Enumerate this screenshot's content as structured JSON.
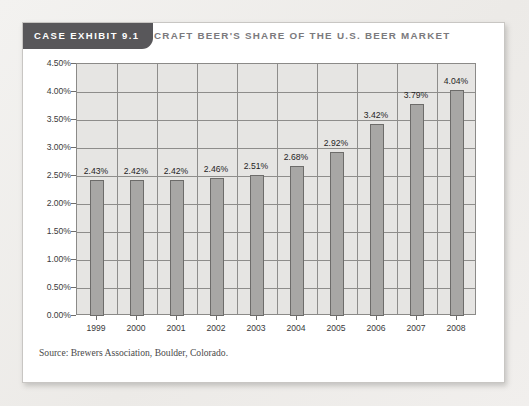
{
  "exhibit": {
    "tab_label": "CASE EXHIBIT 9.1",
    "title": "CRAFT BEER'S SHARE OF THE U.S. BEER MARKET",
    "source_note": "Source: Brewers Association, Boulder, Colorado.",
    "colors": {
      "tab_background": "#58575a",
      "title_text": "#7b7a7d",
      "card_background": "#ffffff",
      "page_background": "#f0efed",
      "plot_background": "#e6e5e3",
      "bar_fill": "#a8a7a5",
      "bar_border": "#6d6c6a",
      "gridline": "#8e8d8b"
    }
  },
  "chart_data": {
    "type": "bar",
    "title": "CRAFT BEER'S SHARE OF THE U.S. BEER MARKET",
    "xlabel": "",
    "ylabel": "",
    "categories": [
      "1999",
      "2000",
      "2001",
      "2002",
      "2003",
      "2004",
      "2005",
      "2006",
      "2007",
      "2008"
    ],
    "values": [
      2.43,
      2.42,
      2.42,
      2.46,
      2.51,
      2.68,
      2.92,
      3.42,
      3.79,
      4.04
    ],
    "data_labels": [
      "2.43%",
      "2.42%",
      "2.42%",
      "2.46%",
      "2.51%",
      "2.68%",
      "2.92%",
      "3.42%",
      "3.79%",
      "4.04%"
    ],
    "ylim": [
      0,
      4.5
    ],
    "ytick_values": [
      0,
      0.5,
      1.0,
      1.5,
      2.0,
      2.5,
      3.0,
      3.5,
      4.0,
      4.5
    ],
    "ytick_labels": [
      "0.00%",
      "0.50%",
      "1.00%",
      "1.50%",
      "2.00%",
      "2.50%",
      "3.00%",
      "3.50%",
      "4.00%",
      "4.50%"
    ],
    "grid": true,
    "legend": false,
    "units": "percent"
  }
}
